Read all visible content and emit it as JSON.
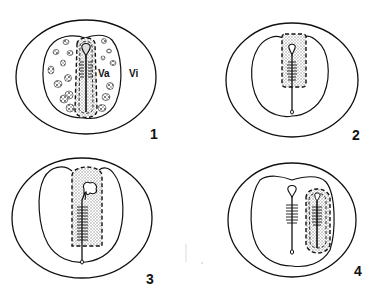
{
  "figure": {
    "panels": [
      {
        "id": "panel-1",
        "number": "1",
        "labels": {
          "inner": "Va",
          "outer": "Vi"
        }
      },
      {
        "id": "panel-2",
        "number": "2"
      },
      {
        "id": "panel-3",
        "number": "3"
      },
      {
        "id": "panel-4",
        "number": "4"
      }
    ],
    "colors": {
      "line": "#111111",
      "stipple": "#9a9a9a",
      "background": "#ffffff"
    }
  }
}
